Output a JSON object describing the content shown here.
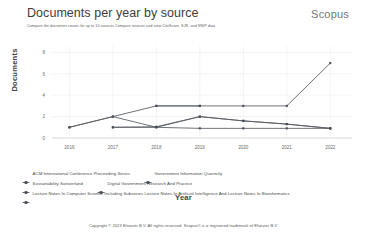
{
  "header": {
    "title": "Documents per year by source",
    "subtitle": "Compare the document counts for up to 10 sources Compare sources and view CiteScore, SJR, and SNIP data",
    "brand": "Scopus"
  },
  "footer": {
    "copyright": "Copyright © 2023 Elsevier B.V. All rights reserved. Scopus® is a registered trademark of Elsevier B.V."
  },
  "legend": {
    "rows": [
      [
        {
          "label": "ACM International Conference Proceeding Series",
          "marker": "line-marker-icon"
        },
        {
          "label": "Government Information Quarterly",
          "marker": "line-marker-icon"
        }
      ],
      [
        {
          "label": "Sustainability Switzerland",
          "marker": "line-marker-icon"
        },
        {
          "label": "Digital Government Research And Practice",
          "marker": "line-marker-icon"
        }
      ],
      [
        {
          "label": "Lecture Notes In Computer Science Including Subseries Lecture Notes In Artificial Intelligence And Lecture Notes In Bioinformatics",
          "marker": "line-marker-icon"
        }
      ]
    ]
  },
  "chart_data": {
    "type": "line",
    "title": "Documents per year by source",
    "xlabel": "Year",
    "ylabel": "Documents",
    "x": [
      2016,
      2017,
      2018,
      2019,
      2020,
      2021,
      2022
    ],
    "categories": [
      "2016",
      "2017",
      "2018",
      "2019",
      "2020",
      "2021",
      "2022"
    ],
    "yticks": [
      0,
      2,
      4,
      6,
      8
    ],
    "ylim": [
      0,
      8.6
    ],
    "xlim": [
      2015.6,
      2022.5
    ],
    "grid": true,
    "legend_position": "bottom",
    "line_color": "#555a60",
    "marker_color": "#4a4f55",
    "series": [
      {
        "name": "ACM International Conference Proceeding Series",
        "x": [
          2016,
          2017,
          2018,
          2019,
          2020,
          2021,
          2022
        ],
        "values": [
          1,
          2,
          1,
          2,
          1.6,
          1.3,
          0.9
        ]
      },
      {
        "name": "Government Information Quarterly",
        "x": [
          2018,
          2019,
          2020,
          2021,
          2022
        ],
        "values": [
          3,
          3,
          3,
          3,
          7
        ]
      },
      {
        "name": "Sustainability Switzerland",
        "x": [
          2017,
          2018,
          2019,
          2020,
          2021,
          2022
        ],
        "values": [
          1,
          1,
          0.9,
          0.9,
          0.9,
          0.9
        ]
      },
      {
        "name": "Digital Government Research And Practice",
        "x": [
          2017,
          2018,
          2019,
          2020,
          2021,
          2022
        ],
        "values": [
          1,
          1.05,
          2,
          1.6,
          1.3,
          0.9
        ]
      },
      {
        "name": "Lecture Notes In Computer Science Including Subseries Lecture Notes In Artificial Intelligence And Lecture Notes In Bioinformatics",
        "x": [
          2016,
          2017,
          2018,
          2019
        ],
        "values": [
          1,
          2,
          3,
          3
        ]
      }
    ]
  }
}
